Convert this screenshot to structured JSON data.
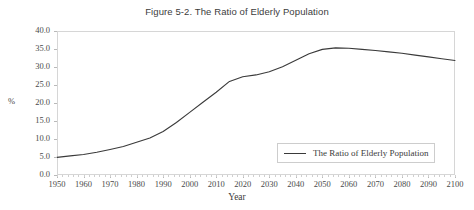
{
  "chart_data": {
    "type": "line",
    "title": "Figure 5-2. The Ratio of Elderly Population",
    "xlabel": "Year",
    "ylabel": "%",
    "xlim": [
      1950,
      2100
    ],
    "ylim": [
      0.0,
      40.0
    ],
    "grid": false,
    "legend_position": "bottom-right",
    "x_ticks": [
      "1950",
      "1960",
      "1970",
      "1980",
      "1990",
      "2000",
      "2010",
      "2020",
      "2030",
      "2040",
      "2050",
      "2060",
      "2070",
      "2080",
      "2090",
      "2100"
    ],
    "y_ticks": [
      "0.0",
      "5.0",
      "10.0",
      "15.0",
      "20.0",
      "25.0",
      "30.0",
      "35.0",
      "40.0"
    ],
    "series": [
      {
        "name": "The Ratio of Elderly Population",
        "color": "#3a3a3a",
        "x": [
          1950,
          1955,
          1960,
          1965,
          1970,
          1975,
          1980,
          1985,
          1990,
          1995,
          2000,
          2005,
          2010,
          2015,
          2020,
          2025,
          2030,
          2035,
          2040,
          2045,
          2050,
          2055,
          2060,
          2065,
          2070,
          2075,
          2080,
          2085,
          2090,
          2095,
          2100
        ],
        "values": [
          4.9,
          5.3,
          5.7,
          6.3,
          7.1,
          7.9,
          9.1,
          10.3,
          12.1,
          14.6,
          17.4,
          20.2,
          23.0,
          26.0,
          27.3,
          27.8,
          28.7,
          30.1,
          31.9,
          33.7,
          34.9,
          35.3,
          35.2,
          34.9,
          34.6,
          34.2,
          33.8,
          33.3,
          32.8,
          32.3,
          31.8
        ]
      }
    ]
  },
  "figure": {
    "title": "Figure 5-2. The Ratio of Elderly Population",
    "axis_x_label": "Year",
    "axis_y_label": "%",
    "legend_entry": "The Ratio of Elderly Population"
  }
}
